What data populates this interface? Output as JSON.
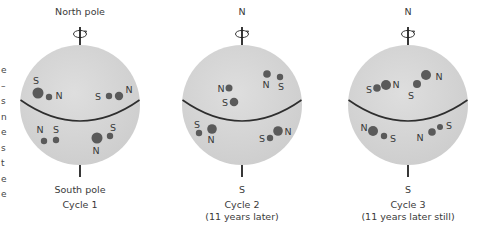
{
  "colors": {
    "sphere_fill": "#d6d6d6",
    "spot": "#5a5a5a",
    "equator": "#2e2e2e",
    "axis": "#222222",
    "text": "#3a3a3a"
  },
  "left_edge_fragments": [
    "e",
    "–",
    "s",
    "n",
    "e",
    "s",
    "t",
    "e",
    "e"
  ],
  "panels": [
    {
      "id": "cycle-1",
      "top_label": "North pole",
      "bottom_label": "South pole",
      "caption": "Cycle 1",
      "caption_sub": "",
      "cx": 80,
      "spots": [
        {
          "x": 38,
          "y": 93,
          "r": 5.5
        },
        {
          "x": 49,
          "y": 97,
          "r": 3.2
        },
        {
          "x": 109,
          "y": 96,
          "r": 3.2
        },
        {
          "x": 119,
          "y": 96,
          "r": 4.2
        },
        {
          "x": 44,
          "y": 141,
          "r": 3.2
        },
        {
          "x": 56,
          "y": 140,
          "r": 3.2
        },
        {
          "x": 97,
          "y": 138,
          "r": 5.5
        },
        {
          "x": 110,
          "y": 136,
          "r": 3.2
        }
      ],
      "labels": [
        {
          "t": "S",
          "x": 36,
          "y": 84
        },
        {
          "t": "N",
          "x": 59,
          "y": 99
        },
        {
          "t": "S",
          "x": 98,
          "y": 100
        },
        {
          "t": "N",
          "x": 129,
          "y": 93
        },
        {
          "t": "N",
          "x": 40,
          "y": 133
        },
        {
          "t": "S",
          "x": 56,
          "y": 133
        },
        {
          "t": "S",
          "x": 113,
          "y": 131
        },
        {
          "t": "N",
          "x": 96,
          "y": 154
        }
      ]
    },
    {
      "id": "cycle-2",
      "top_label": "N",
      "bottom_label": "S",
      "caption": "Cycle 2",
      "caption_sub": "(11 years later)",
      "cx": 242,
      "spots": [
        {
          "x": 229,
          "y": 88,
          "r": 3.5
        },
        {
          "x": 234,
          "y": 102,
          "r": 4.3
        },
        {
          "x": 267,
          "y": 74,
          "r": 3.8
        },
        {
          "x": 280,
          "y": 77,
          "r": 3.2
        },
        {
          "x": 199,
          "y": 133,
          "r": 3.2
        },
        {
          "x": 212,
          "y": 129,
          "r": 4.8
        },
        {
          "x": 270,
          "y": 138,
          "r": 3.2
        },
        {
          "x": 278,
          "y": 131,
          "r": 4.8
        }
      ],
      "labels": [
        {
          "t": "N",
          "x": 221,
          "y": 92
        },
        {
          "t": "S",
          "x": 225,
          "y": 106
        },
        {
          "t": "N",
          "x": 266,
          "y": 88
        },
        {
          "t": "S",
          "x": 281,
          "y": 90
        },
        {
          "t": "S",
          "x": 197,
          "y": 128
        },
        {
          "t": "N",
          "x": 211,
          "y": 143
        },
        {
          "t": "S",
          "x": 262,
          "y": 142
        },
        {
          "t": "N",
          "x": 288,
          "y": 135
        }
      ]
    },
    {
      "id": "cycle-3",
      "top_label": "N",
      "bottom_label": "S",
      "caption": "Cycle 3",
      "caption_sub": "(11 years later still)",
      "cx": 408,
      "spots": [
        {
          "x": 377,
          "y": 88,
          "r": 3.8
        },
        {
          "x": 386,
          "y": 85,
          "r": 5.0
        },
        {
          "x": 417,
          "y": 84,
          "r": 4.0
        },
        {
          "x": 426,
          "y": 75,
          "r": 5.0
        },
        {
          "x": 373,
          "y": 131,
          "r": 5.0
        },
        {
          "x": 384,
          "y": 136,
          "r": 3.2
        },
        {
          "x": 432,
          "y": 132,
          "r": 3.8
        },
        {
          "x": 440,
          "y": 127,
          "r": 3.0
        }
      ],
      "labels": [
        {
          "t": "S",
          "x": 369,
          "y": 93
        },
        {
          "t": "N",
          "x": 396,
          "y": 88
        },
        {
          "t": "S",
          "x": 411,
          "y": 99
        },
        {
          "t": "N",
          "x": 439,
          "y": 80
        },
        {
          "t": "N",
          "x": 364,
          "y": 131
        },
        {
          "t": "S",
          "x": 393,
          "y": 142
        },
        {
          "t": "N",
          "x": 420,
          "y": 141
        },
        {
          "t": "S",
          "x": 449,
          "y": 129
        }
      ]
    }
  ]
}
